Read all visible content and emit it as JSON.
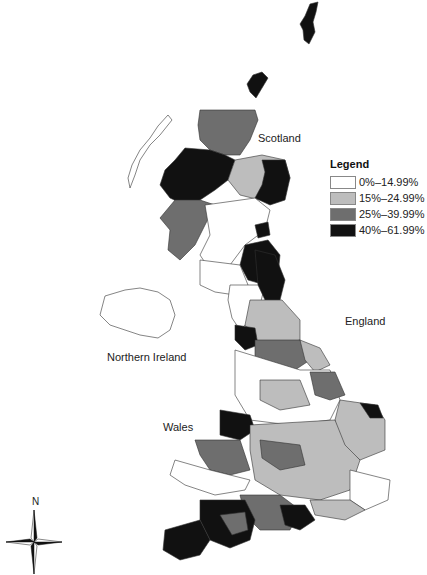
{
  "map": {
    "type": "choropleth",
    "regions": [
      {
        "label": "Scotland",
        "x": 258,
        "y": 137
      },
      {
        "label": "England",
        "x": 345,
        "y": 320
      },
      {
        "label": "Northern Ireland",
        "x": 107,
        "y": 357
      },
      {
        "label": "Wales",
        "x": 163,
        "y": 426
      }
    ],
    "legend": {
      "title": "Legend",
      "items": [
        {
          "label": "0%–14.99%",
          "color": "#ffffff"
        },
        {
          "label": "15%–24.99%",
          "color": "#bdbdbd"
        },
        {
          "label": "25%–39.99%",
          "color": "#6e6e6e"
        },
        {
          "label": "40%–61.99%",
          "color": "#111111"
        }
      ]
    },
    "compass": {
      "north_label": "N"
    }
  }
}
